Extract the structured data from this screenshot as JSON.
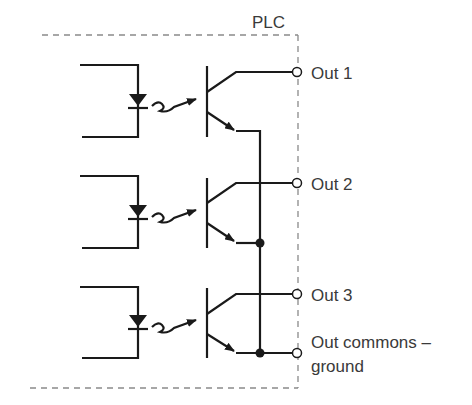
{
  "diagram": {
    "title": "PLC",
    "boundary_style": "dashed",
    "colors": {
      "wire": "#1a1a1a",
      "boundary": "#8a8a8a",
      "text": "#3a3a3a",
      "background": "#ffffff"
    },
    "stages": [
      {
        "id": 1,
        "input": "LED (optocoupler input)",
        "coupling": "light",
        "device": "NPN phototransistor",
        "output_label": "Out 1"
      },
      {
        "id": 2,
        "input": "LED (optocoupler input)",
        "coupling": "light",
        "device": "NPN phototransistor",
        "output_label": "Out 2"
      },
      {
        "id": 3,
        "input": "LED (optocoupler input)",
        "coupling": "light",
        "device": "NPN phototransistor",
        "output_label": "Out 3"
      }
    ],
    "common": {
      "label_line1": "Out commons –",
      "label_line2": "ground"
    }
  }
}
